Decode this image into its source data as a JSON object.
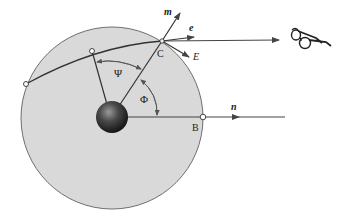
{
  "diagram": {
    "labels": {
      "m": "m",
      "e": "e",
      "E": "E",
      "C": "C",
      "B": "B",
      "n": "n",
      "psi": "Ψ",
      "phi": "Φ"
    },
    "colors": {
      "disk_fill": "#d9d9d9",
      "disk_stroke": "#6e6e6e",
      "line": "#333333",
      "arrow": "#444444",
      "earth": "#2e2e2e"
    },
    "icons": {
      "observer": "eyeglasses-icon"
    }
  }
}
